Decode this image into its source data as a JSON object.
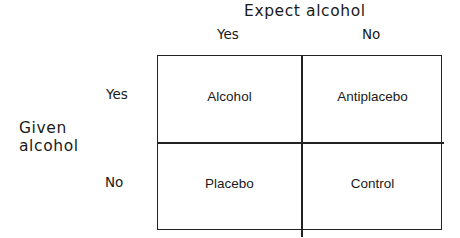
{
  "columns": {
    "title": "Expect alcohol",
    "labels": [
      "Yes",
      "No"
    ]
  },
  "rows": {
    "title_line1": "Given",
    "title_line2": "alcohol",
    "labels": [
      "Yes",
      "No"
    ]
  },
  "cells": [
    [
      "Alcohol",
      "Antiplacebo"
    ],
    [
      "Placebo",
      "Control"
    ]
  ]
}
